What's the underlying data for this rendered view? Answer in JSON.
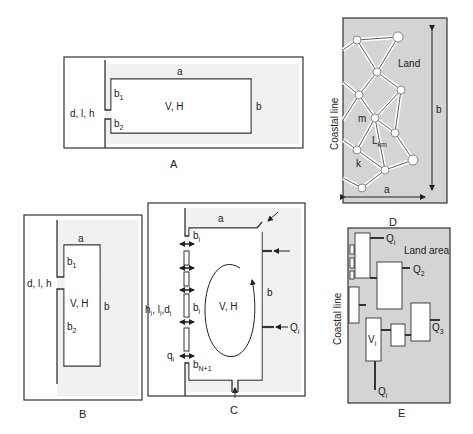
{
  "panels": {
    "A": {
      "label": "A",
      "top_side": "a",
      "right_side": "b",
      "inlet_upper": "b",
      "inlet_upper_sub": "1",
      "inlet_lower": "b",
      "inlet_lower_sub": "2",
      "center": "V, H",
      "channel": "d, l, h"
    },
    "B": {
      "label": "B",
      "top_side": "a",
      "right_side": "b",
      "inlet_upper": "b",
      "inlet_upper_sub": "1",
      "inlet_lower": "b",
      "inlet_lower_sub": "2",
      "center": "V, H",
      "channel": "d, l, h"
    },
    "C": {
      "label": "C",
      "top_side": "a",
      "right_side": "b",
      "inlet_top": "b",
      "inlet_top_sub": "i",
      "inlet_mid": "b",
      "inlet_mid_sub": "i",
      "inlet_bottom": "b",
      "inlet_bottom_sub": "N+1",
      "center": "V, H",
      "channel_h": "h",
      "channel_l": "l",
      "channel_d": "d",
      "channel_sub": "i",
      "flow": "q",
      "flow_sub": "i",
      "inflow": "Q",
      "inflow_sub": "i"
    },
    "D": {
      "label": "D",
      "side_label": "Coastal line",
      "region": "Land",
      "node_m": "m",
      "node_k": "k",
      "link": "L",
      "link_sub": "km",
      "width": "a",
      "height": "b"
    },
    "E": {
      "label": "E",
      "side_label": "Coastal line",
      "region": "Land area",
      "q1": "Q",
      "q1_sub": "i",
      "q2": "Q",
      "q2_sub": "2",
      "q3": "Q",
      "q3_sub": "3",
      "q4": "Q",
      "q4_sub": "i",
      "volume": "V",
      "volume_sub": "i"
    }
  },
  "colors": {
    "stroke": "#2a2a2a",
    "land_fill": "#d6d6d6",
    "light_fill": "#f2f2f2",
    "water": "#ffffff"
  }
}
